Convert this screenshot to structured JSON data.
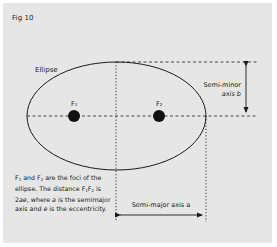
{
  "figure": {
    "title": "Fig 10",
    "ellipse_label": "Ellipse",
    "focus1_label": "F₁",
    "focus2_label": "F₂",
    "semi_minor_label_line1": "Semi-minor",
    "semi_minor_label_line2": "axis b",
    "semi_major_label": "Semi-major axis a",
    "caption": {
      "part1": "F",
      "sub1": "1",
      "part2": " and F",
      "sub2": "2",
      "part3": " are the foci of the ellipse. The distance F",
      "sub3": "1",
      "part4": "F",
      "sub4": "2",
      "part5": " is 2",
      "var_ae": "ae",
      "part6": ", where ",
      "var_a": "a",
      "part7": " is the semimajor axis and ",
      "var_e": "e",
      "part8": " is the eccentricity."
    }
  },
  "colors": {
    "panel_background": "#e6e6e6",
    "ink": "#1a1a1a",
    "page_background": "#ffffff"
  }
}
